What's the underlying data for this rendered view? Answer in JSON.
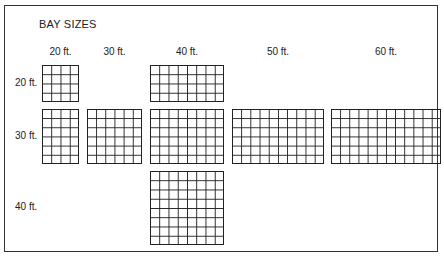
{
  "title": "BAY SIZES",
  "columns": [
    {
      "label": "20 ft.",
      "feet": 20,
      "cells": 4,
      "x": 42,
      "w": 37
    },
    {
      "label": "30 ft.",
      "feet": 30,
      "cells": 6,
      "x": 87,
      "w": 55
    },
    {
      "label": "40 ft.",
      "feet": 40,
      "cells": 8,
      "x": 150,
      "w": 74
    },
    {
      "label": "50 ft.",
      "feet": 50,
      "cells": 10,
      "x": 232,
      "w": 92
    },
    {
      "label": "60 ft.",
      "feet": 60,
      "cells": 12,
      "x": 331,
      "w": 110
    }
  ],
  "rows": [
    {
      "label": "20 ft.",
      "feet": 20,
      "cells": 4,
      "y": 65,
      "h": 37
    },
    {
      "label": "30 ft.",
      "feet": 30,
      "cells": 6,
      "y": 109,
      "h": 55
    },
    {
      "label": "40 ft.",
      "feet": 40,
      "cells": 8,
      "y": 171,
      "h": 74
    }
  ],
  "bays": [
    {
      "col": 0,
      "row": 0,
      "name": "bay-20x20"
    },
    {
      "col": 2,
      "row": 0,
      "name": "bay-40x20"
    },
    {
      "col": 0,
      "row": 1,
      "name": "bay-20x30"
    },
    {
      "col": 1,
      "row": 1,
      "name": "bay-30x30"
    },
    {
      "col": 2,
      "row": 1,
      "name": "bay-40x30"
    },
    {
      "col": 3,
      "row": 1,
      "name": "bay-50x30"
    },
    {
      "col": 4,
      "row": 1,
      "name": "bay-60x30"
    },
    {
      "col": 2,
      "row": 2,
      "name": "bay-40x40"
    }
  ],
  "colors": {
    "line": "#222222",
    "background": "#ffffff"
  }
}
